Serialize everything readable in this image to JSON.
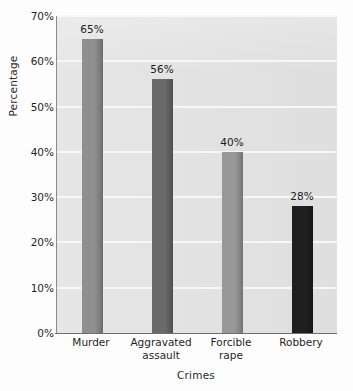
{
  "chart_data": {
    "type": "bar",
    "title": "",
    "xlabel": "Crimes",
    "ylabel": "Percentage",
    "categories": [
      "Murder",
      "Aggravated\nassault",
      "Forcible\nrape",
      "Robbery"
    ],
    "values": [
      65,
      56,
      40,
      28
    ],
    "value_labels": [
      "65%",
      "56%",
      "40%",
      "28%"
    ],
    "ylim": [
      0,
      70
    ],
    "yticks": [
      0,
      10,
      20,
      30,
      40,
      50,
      60,
      70
    ],
    "ytick_labels": [
      "0%",
      "10%",
      "20%",
      "30%",
      "40%",
      "50%",
      "60%",
      "70%"
    ],
    "grid": "horizontal",
    "legend": "none",
    "bar_colors": [
      "#8f8f8f",
      "#6a6a6a",
      "#989898",
      "#1f1f1f"
    ],
    "plot_background": "#e3e3e3",
    "gridline_color": "#f7f7f7",
    "axis_color": "#6e6e6e"
  }
}
